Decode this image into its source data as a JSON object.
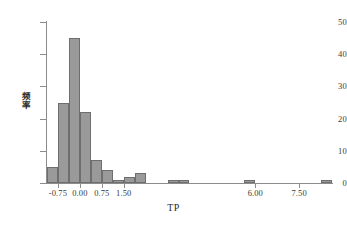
{
  "chart_data": {
    "type": "bar",
    "subtype": "histogram",
    "title": "",
    "xlabel": "TP",
    "ylabel": "频率",
    "ylabel_chars": [
      "频",
      "率"
    ],
    "xlim": [
      -1.125,
      8.625
    ],
    "ylim": [
      0,
      50
    ],
    "grid": false,
    "legend": null,
    "bar_color": "#9a9a9a",
    "bar_edge_color": "#6e6e6e",
    "axis_color": "#8c8c8c",
    "bin_width": 0.375,
    "yticks": [
      0,
      10,
      20,
      30,
      40,
      50
    ],
    "ytick_labels": [
      "0",
      "10",
      "20",
      "30",
      "40",
      "50"
    ],
    "xticks": [
      -0.75,
      0.0,
      0.75,
      1.5,
      6.0,
      7.5
    ],
    "xtick_labels": [
      "-0.75",
      "0.00",
      "0.75",
      "1.50",
      "6.00",
      "7.50"
    ],
    "bins": [
      {
        "x_left": -1.125,
        "x_right": -0.75,
        "value": 5
      },
      {
        "x_left": -0.75,
        "x_right": -0.375,
        "value": 25
      },
      {
        "x_left": -0.375,
        "x_right": 0.0,
        "value": 45
      },
      {
        "x_left": 0.0,
        "x_right": 0.375,
        "value": 22
      },
      {
        "x_left": 0.375,
        "x_right": 0.75,
        "value": 7
      },
      {
        "x_left": 0.75,
        "x_right": 1.125,
        "value": 4
      },
      {
        "x_left": 1.125,
        "x_right": 1.5,
        "value": 1
      },
      {
        "x_left": 1.5,
        "x_right": 1.875,
        "value": 2
      },
      {
        "x_left": 1.875,
        "x_right": 2.25,
        "value": 3
      },
      {
        "x_left": 3.0,
        "x_right": 3.375,
        "value": 1
      },
      {
        "x_left": 3.375,
        "x_right": 3.75,
        "value": 1
      },
      {
        "x_left": 5.625,
        "x_right": 6.0,
        "value": 1
      },
      {
        "x_left": 8.25,
        "x_right": 8.625,
        "value": 1
      }
    ],
    "categories": [
      "-1.125",
      "-0.75",
      "-0.375",
      "0.00",
      "0.375",
      "0.75",
      "1.125",
      "1.50",
      "1.875",
      "3.00",
      "3.375",
      "5.625",
      "8.25"
    ],
    "values": [
      5,
      25,
      45,
      22,
      7,
      4,
      1,
      2,
      3,
      1,
      1,
      1,
      1
    ]
  }
}
